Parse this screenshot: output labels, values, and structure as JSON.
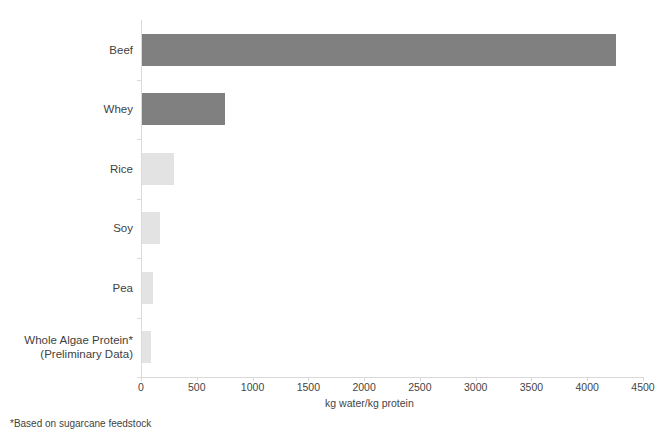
{
  "chart_data": {
    "type": "bar",
    "orientation": "horizontal",
    "title": "",
    "xlabel": "kg water/kg protein",
    "ylabel": "",
    "xlim": [
      0,
      4500
    ],
    "xticks": [
      0,
      500,
      1000,
      1500,
      2000,
      2500,
      3000,
      3500,
      4000,
      4500
    ],
    "xtick_labels": [
      "0",
      "500",
      "1000",
      "1500",
      "2000",
      "2500",
      "3000",
      "3500",
      "4000",
      "4500"
    ],
    "grid": false,
    "legend": null,
    "categories": [
      "Beef",
      "Whey",
      "Rice",
      "Soy",
      "Pea",
      "Whole Algae Protein*\n(Preliminary Data)"
    ],
    "values": [
      4250,
      740,
      290,
      160,
      100,
      85
    ],
    "bar_colors": [
      "#808080",
      "#808080",
      "#e3e3e3",
      "#e3e3e3",
      "#e3e3e3",
      "#e3e3e3"
    ],
    "annotations": [
      "*Based on sugarcane feedstock"
    ]
  },
  "chart": {
    "axis_title": "kg water/kg protein",
    "footnote": "*Based on sugarcane feedstock",
    "categories": [
      {
        "label": "Beef",
        "label_line2": "",
        "value": 4250,
        "color": "#808080"
      },
      {
        "label": "Whey",
        "label_line2": "",
        "value": 740,
        "color": "#808080"
      },
      {
        "label": "Rice",
        "label_line2": "",
        "value": 290,
        "color": "#e3e3e3"
      },
      {
        "label": "Soy",
        "label_line2": "",
        "value": 160,
        "color": "#e3e3e3"
      },
      {
        "label": "Pea",
        "label_line2": "",
        "value": 100,
        "color": "#e3e3e3"
      },
      {
        "label": "Whole Algae Protein*",
        "label_line2": "(Preliminary Data)",
        "value": 85,
        "color": "#e3e3e3"
      }
    ],
    "xticks": [
      {
        "label": "0"
      },
      {
        "label": "500"
      },
      {
        "label": "1000"
      },
      {
        "label": "1500"
      },
      {
        "label": "2000"
      },
      {
        "label": "2500"
      },
      {
        "label": "3000"
      },
      {
        "label": "3500"
      },
      {
        "label": "4000"
      },
      {
        "label": "4500"
      }
    ],
    "colors": {
      "axis": "#d9d9d9",
      "bar_dark": "#808080",
      "bar_light": "#e3e3e3",
      "text": "#3f3f3f",
      "background": "#ffffff"
    }
  }
}
